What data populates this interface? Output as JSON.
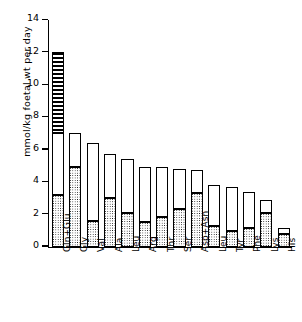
{
  "chart_data": {
    "type": "bar",
    "title": "",
    "subtitle": "",
    "xlabel": "",
    "ylabel": "mmol/kg foetal wt per day",
    "ylim": [
      0,
      14
    ],
    "yticks": [
      0,
      2,
      4,
      6,
      8,
      10,
      12,
      14
    ],
    "ytick_labels": [
      "0",
      "2",
      "4",
      "6",
      "8",
      "10",
      "12",
      "14"
    ],
    "grid": false,
    "legend_position": "none",
    "stacked": true,
    "categories": [
      "Gln+Glu",
      "Gly",
      "Val",
      "Ala",
      "Leu",
      "Arg",
      "Thr",
      "Ser",
      "Asp+Asn",
      "Leu",
      "Tyr",
      "Phe",
      "Lys",
      "His"
    ],
    "series": [
      {
        "name": "lower-segment",
        "pattern": "stippled",
        "values": [
          3.2,
          4.95,
          1.6,
          3.0,
          2.1,
          1.55,
          1.8,
          2.35,
          3.3,
          1.25,
          0.95,
          1.15,
          2.1,
          0.8
        ]
      },
      {
        "name": "upper-segment",
        "pattern": "open",
        "values": [
          3.8,
          2.05,
          4.8,
          2.7,
          3.3,
          3.4,
          3.1,
          2.45,
          1.45,
          2.55,
          2.75,
          2.25,
          0.8,
          0.35
        ]
      },
      {
        "name": "top-segment",
        "pattern": "horizontal-hatch",
        "values": [
          5.0,
          0,
          0,
          0,
          0,
          0,
          0,
          0,
          0,
          0,
          0,
          0,
          0,
          0
        ]
      }
    ],
    "totals": [
      12.0,
      7.0,
      6.4,
      5.7,
      5.4,
      4.95,
      4.9,
      4.8,
      4.75,
      3.8,
      3.7,
      3.4,
      2.9,
      1.15
    ]
  }
}
